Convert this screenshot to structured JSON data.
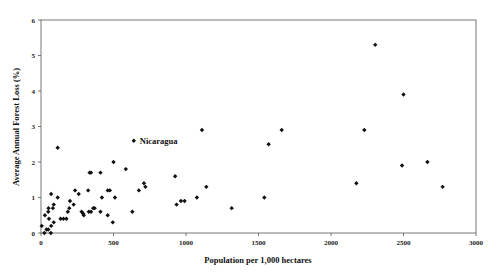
{
  "chart_data": {
    "type": "scatter",
    "title": "",
    "xlabel": "Population per 1,000 hectares",
    "ylabel": "Average Annual Forest Loss (%)",
    "xlim": [
      0,
      3000
    ],
    "ylim": [
      0,
      6
    ],
    "x_ticks": [
      0,
      500,
      1000,
      1500,
      2000,
      2500,
      3000
    ],
    "y_ticks": [
      0,
      1,
      2,
      3,
      4,
      5,
      6
    ],
    "grid": false,
    "legend": null,
    "marker": "diamond",
    "annotations": [
      {
        "text": "Nicaragua",
        "x": 640,
        "y": 2.6
      }
    ],
    "points": [
      [
        5,
        0.2
      ],
      [
        23,
        0.0
      ],
      [
        27,
        0.5
      ],
      [
        38,
        0.1
      ],
      [
        50,
        0.1
      ],
      [
        50,
        0.6
      ],
      [
        52,
        0.7
      ],
      [
        55,
        0.4
      ],
      [
        68,
        0.0
      ],
      [
        70,
        1.1
      ],
      [
        70,
        0.2
      ],
      [
        82,
        0.7
      ],
      [
        88,
        0.8
      ],
      [
        88,
        0.3
      ],
      [
        115,
        2.4
      ],
      [
        115,
        1.0
      ],
      [
        135,
        0.4
      ],
      [
        155,
        0.4
      ],
      [
        175,
        0.4
      ],
      [
        185,
        0.6
      ],
      [
        195,
        0.7
      ],
      [
        200,
        0.9
      ],
      [
        225,
        0.8
      ],
      [
        235,
        1.2
      ],
      [
        260,
        1.1
      ],
      [
        280,
        0.6
      ],
      [
        290,
        0.55
      ],
      [
        295,
        0.5
      ],
      [
        325,
        1.2
      ],
      [
        330,
        0.6
      ],
      [
        345,
        0.6
      ],
      [
        335,
        1.7
      ],
      [
        345,
        1.7
      ],
      [
        360,
        0.7
      ],
      [
        370,
        0.7
      ],
      [
        410,
        1.7
      ],
      [
        410,
        0.6
      ],
      [
        420,
        1.0
      ],
      [
        460,
        0.5
      ],
      [
        460,
        1.2
      ],
      [
        475,
        1.2
      ],
      [
        495,
        0.3
      ],
      [
        500,
        2.0
      ],
      [
        510,
        1.0
      ],
      [
        585,
        1.8
      ],
      [
        630,
        0.6
      ],
      [
        640,
        2.6
      ],
      [
        675,
        1.2
      ],
      [
        710,
        1.4
      ],
      [
        720,
        1.3
      ],
      [
        925,
        1.6
      ],
      [
        935,
        0.8
      ],
      [
        965,
        0.9
      ],
      [
        990,
        0.9
      ],
      [
        1075,
        1.0
      ],
      [
        1110,
        2.9
      ],
      [
        1140,
        1.3
      ],
      [
        1315,
        0.7
      ],
      [
        1540,
        1.0
      ],
      [
        1570,
        2.5
      ],
      [
        1660,
        2.9
      ],
      [
        2175,
        1.4
      ],
      [
        2230,
        2.9
      ],
      [
        2305,
        5.3
      ],
      [
        2490,
        1.9
      ],
      [
        2500,
        3.9
      ],
      [
        2665,
        2.0
      ],
      [
        2770,
        1.3
      ]
    ]
  }
}
